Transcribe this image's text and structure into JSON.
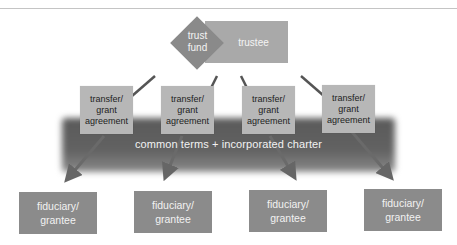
{
  "diagram": {
    "top_node": {
      "fund_label": "trust fund",
      "fund_line1": "trust",
      "fund_line2": "fund",
      "trustee_label": "trustee"
    },
    "agreements": [
      {
        "line1": "transfer/",
        "line2": "grant",
        "line3": "agreement"
      },
      {
        "line1": "transfer/",
        "line2": "grant",
        "line3": "agreement"
      },
      {
        "line1": "transfer/",
        "line2": "grant",
        "line3": "agreement"
      },
      {
        "line1": "transfer/",
        "line2": "grant",
        "line3": "agreement"
      }
    ],
    "band_label": "common terms + incorporated charter",
    "grantees": [
      {
        "line1": "fiduciary/",
        "line2": "grantee"
      },
      {
        "line1": "fiduciary/",
        "line2": "grantee"
      },
      {
        "line1": "fiduciary/",
        "line2": "grantee"
      },
      {
        "line1": "fiduciary/",
        "line2": "grantee"
      }
    ],
    "colors": {
      "diamond": "#8a8a8a",
      "trustee": "#a9a9a9",
      "agreement": "#b7b7b7",
      "band": "#5a5a5a",
      "grantee": "#8b8b8b",
      "connector": "#555555",
      "arrow": "#6a6a6a"
    }
  }
}
